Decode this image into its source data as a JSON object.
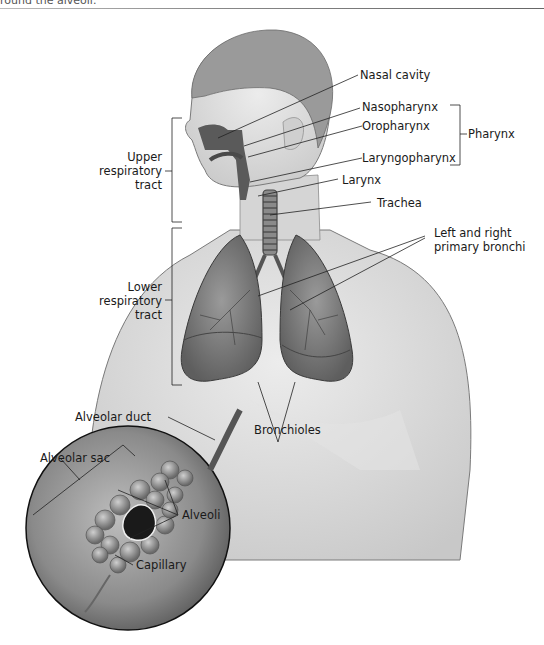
{
  "caption_fragment": "round the alveoli.",
  "figure": {
    "labels": {
      "nasal_cavity": "Nasal cavity",
      "nasopharynx": "Nasopharynx",
      "oropharynx": "Oropharynx",
      "laryngopharynx": "Laryngopharynx",
      "pharynx": "Pharynx",
      "larynx": "Larynx",
      "trachea": "Trachea",
      "bronchi_line1": "Left and right",
      "bronchi_line2": "primary bronchi",
      "upper_line1": "Upper",
      "upper_line2": "respiratory",
      "upper_line3": "tract",
      "lower_line1": "Lower",
      "lower_line2": "respiratory",
      "lower_line3": "tract",
      "bronchioles": "Bronchioles",
      "alveolar_duct": "Alveolar duct",
      "alveolar_sac": "Alveolar sac",
      "alveoli": "Alveoli",
      "capillary": "Capillary"
    },
    "colors": {
      "skin": "#d9d9d9",
      "hair": "#9a9a9a",
      "airway": "#5a5a5a",
      "lung": "#7a7a7a",
      "line": "#222222"
    }
  }
}
